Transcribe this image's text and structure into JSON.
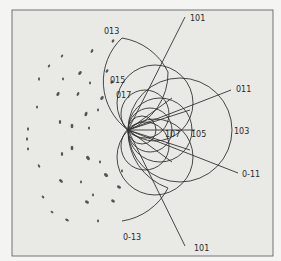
{
  "figure": {
    "type": "stereographic zone-circle diagram with diffraction spot pattern",
    "colors": {
      "background": "#f4f4f2",
      "panel": "#e9e9e6",
      "ink": "#333333",
      "spot": "#555555"
    },
    "labels": {
      "l013": "013",
      "l101_top": "101",
      "l015": "015",
      "l017": "017",
      "l011": "011",
      "l107": "107",
      "l105": "105",
      "l103": "103",
      "l0m11": "0-11",
      "l0m13": "0-13",
      "l101_bottom": "101"
    }
  }
}
